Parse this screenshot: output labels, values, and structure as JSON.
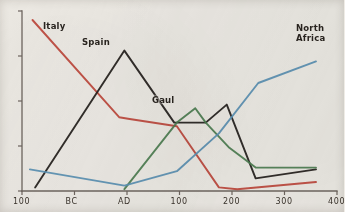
{
  "chart_data": {
    "type": "line",
    "title": "",
    "subtitle": "",
    "xlabel": "",
    "ylabel": "",
    "xlim": [
      -200,
      400
    ],
    "ylim": [
      0,
      100
    ],
    "grid": false,
    "legend_position": "inline-annotations",
    "x_ticks": [
      {
        "value": -200,
        "label": "100"
      },
      {
        "value": -100,
        "label": "BC"
      },
      {
        "value": 0,
        "label": "AD"
      },
      {
        "value": 100,
        "label": "100"
      },
      {
        "value": 200,
        "label": "200"
      },
      {
        "value": 300,
        "label": "300"
      },
      {
        "value": 400,
        "label": "400"
      }
    ],
    "y_ticks": [
      {
        "value": 100,
        "label": ""
      },
      {
        "value": 75,
        "label": ""
      },
      {
        "value": 50,
        "label": ""
      },
      {
        "value": 25,
        "label": ""
      },
      {
        "value": 0,
        "label": ""
      }
    ],
    "series": [
      {
        "name": "Italy",
        "color": "#c0483c",
        "label_text": "Italy",
        "points": [
          {
            "x": -180,
            "y": 95
          },
          {
            "x": -15,
            "y": 41
          },
          {
            "x": 5,
            "y": 40
          },
          {
            "x": 95,
            "y": 36
          },
          {
            "x": 175,
            "y": 2
          },
          {
            "x": 210,
            "y": 1
          },
          {
            "x": 360,
            "y": 5
          }
        ]
      },
      {
        "name": "Spain",
        "color": "#241f1c",
        "label_text": "Spain",
        "points": [
          {
            "x": -175,
            "y": 2
          },
          {
            "x": -5,
            "y": 78
          },
          {
            "x": 90,
            "y": 38
          },
          {
            "x": 150,
            "y": 38
          },
          {
            "x": 190,
            "y": 48
          },
          {
            "x": 245,
            "y": 7
          },
          {
            "x": 360,
            "y": 12
          }
        ]
      },
      {
        "name": "Gaul",
        "color": "#4e7f52",
        "label_text": "Gaul",
        "points": [
          {
            "x": -5,
            "y": 1
          },
          {
            "x": 95,
            "y": 38
          },
          {
            "x": 130,
            "y": 46
          },
          {
            "x": 150,
            "y": 38
          },
          {
            "x": 195,
            "y": 24
          },
          {
            "x": 245,
            "y": 13
          },
          {
            "x": 360,
            "y": 13
          }
        ]
      },
      {
        "name": "North Africa",
        "color": "#5b92b5",
        "label_text": "North\nAfrica",
        "points": [
          {
            "x": -185,
            "y": 12
          },
          {
            "x": -5,
            "y": 3
          },
          {
            "x": 95,
            "y": 11
          },
          {
            "x": 175,
            "y": 32
          },
          {
            "x": 250,
            "y": 60
          },
          {
            "x": 360,
            "y": 72
          }
        ]
      }
    ],
    "annotations": [
      {
        "name": "italy-label",
        "text": "Italy",
        "x_px": 43,
        "y_px": 22
      },
      {
        "name": "spain-label",
        "text": "Spain",
        "x_px": 82,
        "y_px": 38
      },
      {
        "name": "gaul-label",
        "text": "Gaul",
        "x_px": 152,
        "y_px": 96
      },
      {
        "name": "north-africa-label",
        "text": "North\nAfrica",
        "x_px": 296,
        "y_px": 24
      }
    ]
  },
  "axes": {
    "axis_color": "#6f6760",
    "background": "#efece6"
  }
}
